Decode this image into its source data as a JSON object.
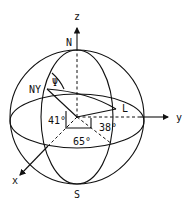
{
  "diagram": {
    "type": "spherical-coordinates",
    "axes": {
      "z_label": "z",
      "y_label": "y",
      "x_label": "x"
    },
    "poles": {
      "north": "N",
      "south": "S"
    },
    "points": {
      "new_york": "NY",
      "london": "L"
    },
    "angles": {
      "psi": "Ψ",
      "ny_latitude": "41°",
      "london_latitude": "38°",
      "longitude_difference": "65°"
    },
    "colors": {
      "stroke": "#111111",
      "background": "#ffffff"
    }
  }
}
